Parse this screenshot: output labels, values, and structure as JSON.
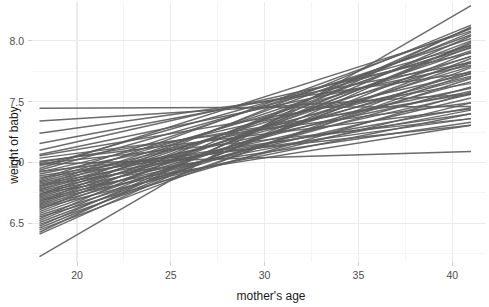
{
  "chart_data": {
    "type": "line",
    "title": "",
    "subtitle": "",
    "xlabel": "mother's age",
    "ylabel": "weight of baby",
    "xlim": [
      17.6,
      41.8
    ],
    "ylim": [
      6.18,
      8.32
    ],
    "xticks": [
      20,
      25,
      30,
      35,
      40
    ],
    "xticklabels": [
      "20",
      "25",
      "30",
      "35",
      "40"
    ],
    "yticks": [
      6.5,
      7.0,
      7.5,
      8.0
    ],
    "yticklabels": [
      "6.5",
      "7.0",
      "7.5",
      "8.0"
    ],
    "x_minor_ticks": [
      22.5,
      27.5,
      32.5,
      37.5
    ],
    "y_minor_ticks": [
      6.25,
      6.75,
      7.25,
      7.75
    ],
    "grid": true,
    "grid_major_color": "#ebebeb",
    "grid_minor_color": "#f4f4f4",
    "legend": false,
    "legend_position": "none",
    "line_color": "#5e5e5e",
    "line_width": 1.45,
    "panel_background": "#ffffff",
    "x_domain": [
      18,
      41
    ],
    "series_count": 60,
    "series": [
      {
        "name": "draw-01",
        "x": [
          18,
          41
        ],
        "values": [
          7.445,
          7.46
        ]
      },
      {
        "name": "draw-02",
        "x": [
          18,
          41
        ],
        "values": [
          7.34,
          7.56
        ]
      },
      {
        "name": "draw-03",
        "x": [
          18,
          41
        ],
        "values": [
          7.24,
          7.74
        ]
      },
      {
        "name": "draw-04",
        "x": [
          18,
          41
        ],
        "values": [
          7.155,
          7.82
        ]
      },
      {
        "name": "draw-05",
        "x": [
          18,
          41
        ],
        "values": [
          7.1,
          7.9
        ]
      },
      {
        "name": "draw-06",
        "x": [
          18,
          41
        ],
        "values": [
          7.065,
          7.8
        ]
      },
      {
        "name": "draw-07",
        "x": [
          18,
          41
        ],
        "values": [
          7.035,
          7.49
        ]
      },
      {
        "name": "draw-08",
        "x": [
          18,
          41
        ],
        "values": [
          7.01,
          7.44
        ]
      },
      {
        "name": "draw-09",
        "x": [
          18,
          41
        ],
        "values": [
          6.985,
          7.09
        ]
      },
      {
        "name": "draw-10",
        "x": [
          18,
          41
        ],
        "values": [
          6.97,
          7.965
        ]
      },
      {
        "name": "draw-11",
        "x": [
          18,
          41
        ],
        "values": [
          6.95,
          8.08
        ]
      },
      {
        "name": "draw-12",
        "x": [
          18,
          41
        ],
        "values": [
          6.935,
          7.94
        ]
      },
      {
        "name": "draw-13",
        "x": [
          18,
          41
        ],
        "values": [
          6.92,
          7.73
        ]
      },
      {
        "name": "draw-14",
        "x": [
          18,
          41
        ],
        "values": [
          6.905,
          7.61
        ]
      },
      {
        "name": "draw-15",
        "x": [
          18,
          41
        ],
        "values": [
          6.89,
          7.4
        ]
      },
      {
        "name": "draw-16",
        "x": [
          18,
          41
        ],
        "values": [
          6.875,
          7.36
        ]
      },
      {
        "name": "draw-17",
        "x": [
          18,
          41
        ],
        "values": [
          6.86,
          8.02
        ]
      },
      {
        "name": "draw-18",
        "x": [
          18,
          41
        ],
        "values": [
          6.85,
          7.87
        ]
      },
      {
        "name": "draw-19",
        "x": [
          18,
          41
        ],
        "values": [
          6.84,
          7.71
        ]
      },
      {
        "name": "draw-20",
        "x": [
          18,
          41
        ],
        "values": [
          6.83,
          7.585
        ]
      },
      {
        "name": "draw-21",
        "x": [
          18,
          41
        ],
        "values": [
          6.82,
          7.45
        ]
      },
      {
        "name": "draw-22",
        "x": [
          18,
          41
        ],
        "values": [
          6.81,
          7.33
        ]
      },
      {
        "name": "draw-23",
        "x": [
          18,
          41
        ],
        "values": [
          6.8,
          8.1
        ]
      },
      {
        "name": "draw-24",
        "x": [
          18,
          41
        ],
        "values": [
          6.79,
          7.96
        ]
      },
      {
        "name": "draw-25",
        "x": [
          18,
          41
        ],
        "values": [
          6.78,
          7.83
        ]
      },
      {
        "name": "draw-26",
        "x": [
          18,
          41
        ],
        "values": [
          6.775,
          7.7
        ]
      },
      {
        "name": "draw-27",
        "x": [
          18,
          41
        ],
        "values": [
          6.765,
          7.56
        ]
      },
      {
        "name": "draw-28",
        "x": [
          18,
          41
        ],
        "values": [
          6.755,
          7.43
        ]
      },
      {
        "name": "draw-29",
        "x": [
          18,
          41
        ],
        "values": [
          6.745,
          7.305
        ]
      },
      {
        "name": "draw-30",
        "x": [
          18,
          41
        ],
        "values": [
          6.735,
          8.05
        ]
      },
      {
        "name": "draw-31",
        "x": [
          18,
          41
        ],
        "values": [
          6.725,
          7.92
        ]
      },
      {
        "name": "draw-32",
        "x": [
          18,
          41
        ],
        "values": [
          6.715,
          7.79
        ]
      },
      {
        "name": "draw-33",
        "x": [
          18,
          41
        ],
        "values": [
          6.705,
          7.665
        ]
      },
      {
        "name": "draw-34",
        "x": [
          18,
          41
        ],
        "values": [
          6.695,
          7.53
        ]
      },
      {
        "name": "draw-35",
        "x": [
          18,
          41
        ],
        "values": [
          6.685,
          7.4
        ]
      },
      {
        "name": "draw-36",
        "x": [
          18,
          41
        ],
        "values": [
          6.675,
          8.13
        ]
      },
      {
        "name": "draw-37",
        "x": [
          18,
          41
        ],
        "values": [
          6.665,
          8.0
        ]
      },
      {
        "name": "draw-38",
        "x": [
          18,
          41
        ],
        "values": [
          6.655,
          7.875
        ]
      },
      {
        "name": "draw-39",
        "x": [
          18,
          41
        ],
        "values": [
          6.645,
          7.75
        ]
      },
      {
        "name": "draw-40",
        "x": [
          18,
          41
        ],
        "values": [
          6.635,
          7.62
        ]
      },
      {
        "name": "draw-41",
        "x": [
          18,
          41
        ],
        "values": [
          6.625,
          7.49
        ]
      },
      {
        "name": "draw-42",
        "x": [
          18,
          41
        ],
        "values": [
          6.61,
          8.07
        ]
      },
      {
        "name": "draw-43",
        "x": [
          18,
          41
        ],
        "values": [
          6.595,
          7.95
        ]
      },
      {
        "name": "draw-44",
        "x": [
          18,
          41
        ],
        "values": [
          6.58,
          7.82
        ]
      },
      {
        "name": "draw-45",
        "x": [
          18,
          41
        ],
        "values": [
          6.565,
          7.69
        ]
      },
      {
        "name": "draw-46",
        "x": [
          18,
          41
        ],
        "values": [
          6.55,
          7.575
        ]
      },
      {
        "name": "draw-47",
        "x": [
          18,
          41
        ],
        "values": [
          6.535,
          8.11
        ]
      },
      {
        "name": "draw-48",
        "x": [
          18,
          41
        ],
        "values": [
          6.52,
          7.98
        ]
      },
      {
        "name": "draw-49",
        "x": [
          18,
          41
        ],
        "values": [
          6.505,
          7.855
        ]
      },
      {
        "name": "draw-50",
        "x": [
          18,
          41
        ],
        "values": [
          6.49,
          7.735
        ]
      },
      {
        "name": "draw-51",
        "x": [
          18,
          41
        ],
        "values": [
          6.475,
          8.04
        ]
      },
      {
        "name": "draw-52",
        "x": [
          18,
          41
        ],
        "values": [
          6.46,
          7.91
        ]
      },
      {
        "name": "draw-53",
        "x": [
          18,
          41
        ],
        "values": [
          6.445,
          7.78
        ]
      },
      {
        "name": "draw-54",
        "x": [
          18,
          41
        ],
        "values": [
          6.425,
          8.115
        ]
      },
      {
        "name": "draw-55",
        "x": [
          18,
          41
        ],
        "values": [
          6.41,
          7.99
        ]
      },
      {
        "name": "draw-56",
        "x": [
          18,
          41
        ],
        "values": [
          7.0,
          7.565
        ]
      },
      {
        "name": "draw-57",
        "x": [
          18,
          41
        ],
        "values": [
          7.055,
          7.65
        ]
      },
      {
        "name": "draw-58",
        "x": [
          18,
          41
        ],
        "values": [
          6.925,
          7.305
        ]
      },
      {
        "name": "draw-59",
        "x": [
          18,
          41
        ],
        "values": [
          6.99,
          7.36
        ]
      },
      {
        "name": "draw-60",
        "x": [
          18,
          41
        ],
        "values": [
          6.225,
          8.29
        ]
      }
    ]
  },
  "axes": {
    "x_title": "mother's age",
    "y_title": "weight of baby"
  }
}
